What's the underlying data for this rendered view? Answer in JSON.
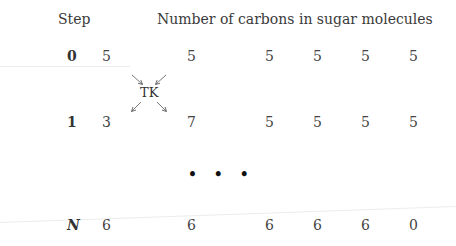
{
  "header": {
    "step_label": "Step",
    "title": "Number of carbons in sugar molecules"
  },
  "rows": [
    {
      "step": "0",
      "values": [
        "5",
        "5",
        "5",
        "5",
        "5",
        "5"
      ]
    },
    {
      "step": "1",
      "values": [
        "3",
        "7",
        "5",
        "5",
        "5",
        "5"
      ]
    },
    {
      "step": "N",
      "values": [
        "6",
        "6",
        "6",
        "6",
        "6",
        "0"
      ]
    }
  ],
  "enzyme_label": "TK",
  "ellipsis": "• • •",
  "icons": {
    "arrows_in": "arrows converging to TK",
    "arrows_out": "arrows diverging from TK"
  }
}
